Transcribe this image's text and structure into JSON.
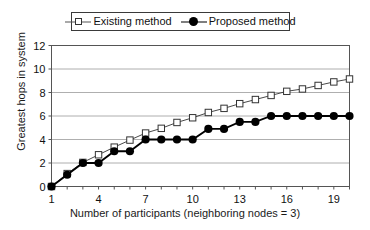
{
  "chart_data": {
    "type": "line",
    "title": "",
    "xlabel": "Number of participants (neighboring nodes = 3)",
    "ylabel": "Greatest hops in system",
    "xlim": [
      1,
      20
    ],
    "ylim": [
      0,
      12
    ],
    "x": [
      1,
      2,
      3,
      4,
      5,
      6,
      7,
      8,
      9,
      10,
      11,
      12,
      13,
      14,
      15,
      16,
      17,
      18,
      19,
      20
    ],
    "xticks": [
      1,
      4,
      7,
      10,
      13,
      16,
      19
    ],
    "xtick_labels": [
      "1",
      "4",
      "7",
      "10",
      "13",
      "16",
      "19"
    ],
    "yticks": [
      0,
      2,
      4,
      6,
      8,
      10,
      12
    ],
    "ytick_labels": [
      "0",
      "2",
      "4",
      "6",
      "8",
      "10",
      "12"
    ],
    "grid": "horizontal",
    "legend_position": "top-center",
    "series": [
      {
        "name": "Existing method",
        "marker": "open-square",
        "color": "#333333",
        "values": [
          0,
          1.1,
          2.05,
          2.7,
          3.35,
          3.95,
          4.55,
          4.95,
          5.45,
          5.85,
          6.3,
          6.65,
          7.05,
          7.4,
          7.75,
          8.1,
          8.3,
          8.6,
          8.9,
          9.15
        ]
      },
      {
        "name": "Proposed method",
        "marker": "filled-circle",
        "color": "#000000",
        "values": [
          0,
          1,
          2,
          2,
          3,
          3,
          4,
          4,
          4,
          4,
          4.9,
          4.9,
          5.5,
          5.5,
          6,
          6,
          6,
          6,
          6,
          6
        ]
      }
    ]
  },
  "legend": {
    "items": [
      {
        "label": "Existing method",
        "marker": "open-square"
      },
      {
        "label": "Proposed method",
        "marker": "filled-circle"
      }
    ]
  },
  "axes": {
    "x_title": "Number of participants (neighboring nodes = 3)",
    "y_title": "Greatest hops in system"
  }
}
